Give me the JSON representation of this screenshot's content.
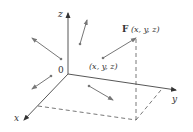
{
  "diagram": {
    "type": "3d-vector-field",
    "axes": {
      "x_label": "x",
      "y_label": "y",
      "z_label": "z",
      "origin_label": "0"
    },
    "point_label": "(x, y, z)",
    "vector_label_F": "F",
    "vector_label_args": "(x, y, z)",
    "colors": {
      "axis": "#444444",
      "vector": "#777777",
      "dashed": "#555555",
      "text": "#333333"
    },
    "vectors": [
      {
        "from": [
          61,
          59
        ],
        "to": [
          32,
          38
        ]
      },
      {
        "from": [
          80,
          44
        ],
        "to": [
          87,
          20
        ]
      },
      {
        "from": [
          103,
          58
        ],
        "to": [
          136,
          38
        ]
      },
      {
        "from": [
          51,
          76
        ],
        "to": [
          32,
          89
        ]
      },
      {
        "from": [
          89,
          86
        ],
        "to": [
          113,
          100
        ]
      }
    ]
  }
}
